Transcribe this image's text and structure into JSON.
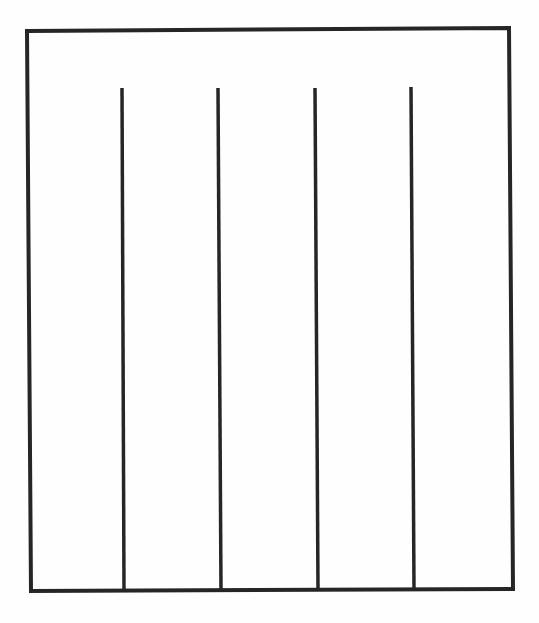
{
  "diagram": {
    "type": "rectangle-with-vertical-dividers",
    "stroke_color": "#262626",
    "background_color": "#fefefe",
    "outer_frame": {
      "top_left": [
        27,
        31
      ],
      "top_right": [
        509,
        28
      ],
      "bottom_right": [
        513,
        589
      ],
      "bottom_left": [
        31,
        591
      ],
      "stroke_width": 4
    },
    "vertical_lines": [
      {
        "x_top": 122,
        "y_top": 88,
        "x_bottom": 124,
        "y_bottom": 590,
        "stroke_width": 3.5
      },
      {
        "x_top": 218,
        "y_top": 88,
        "x_bottom": 221,
        "y_bottom": 590,
        "stroke_width": 3.5
      },
      {
        "x_top": 315,
        "y_top": 88,
        "x_bottom": 318,
        "y_bottom": 589,
        "stroke_width": 3.5
      },
      {
        "x_top": 411,
        "y_top": 87,
        "x_bottom": 414,
        "y_bottom": 589,
        "stroke_width": 3.5
      }
    ],
    "columns": 5
  }
}
